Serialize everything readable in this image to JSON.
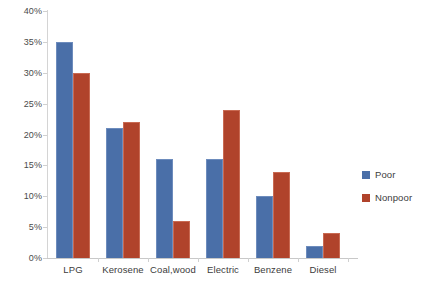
{
  "chart_data": {
    "type": "bar",
    "title": "",
    "xlabel": "",
    "ylabel": "",
    "ylim": [
      0,
      40
    ],
    "ytick_labels": [
      "0%",
      "5%",
      "10%",
      "15%",
      "20%",
      "25%",
      "30%",
      "35%",
      "40%"
    ],
    "ytick_values": [
      0,
      5,
      10,
      15,
      20,
      25,
      30,
      35,
      40
    ],
    "grid": false,
    "legend_position": "right",
    "categories": [
      "LPG",
      "Kerosene",
      "Coal,wood",
      "Electric",
      "Benzene",
      "Diesel"
    ],
    "series": [
      {
        "name": "Poor",
        "color": "#4A6FA8",
        "values": [
          35,
          21,
          16,
          16,
          10,
          2
        ]
      },
      {
        "name": "Nonpoor",
        "color": "#B0432B",
        "values": [
          30,
          22,
          6,
          24,
          14,
          4
        ]
      }
    ]
  },
  "legend": {
    "items": [
      {
        "label": "Poor",
        "color": "#4A6FA8"
      },
      {
        "label": "Nonpoor",
        "color": "#B0432B"
      }
    ]
  }
}
